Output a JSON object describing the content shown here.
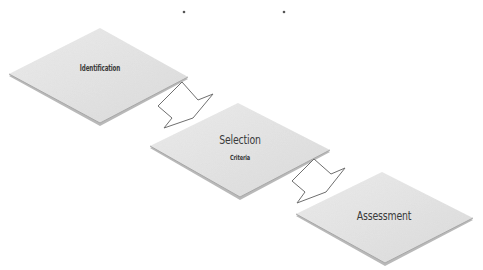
{
  "diagram": {
    "type": "process-flow",
    "steps": [
      {
        "title": "Identification",
        "subtitle": "",
        "polygon": [
          [
            9,
            74
          ],
          [
            100,
            28
          ],
          [
            188,
            77
          ],
          [
            100,
            123
          ]
        ],
        "label_pos": [
          100,
          69
        ]
      },
      {
        "title": "Selection",
        "subtitle": "Criteria",
        "polygon": [
          [
            150,
            146
          ],
          [
            238,
            103
          ],
          [
            330,
            150
          ],
          [
            240,
            197
          ]
        ],
        "label_pos": [
          240,
          138
        ],
        "sub_pos": [
          240,
          158
        ]
      },
      {
        "title": "Assessment",
        "subtitle": "",
        "polygon": [
          [
            296,
            214
          ],
          [
            382,
            172
          ],
          [
            473,
            218
          ],
          [
            385,
            263
          ]
        ],
        "label_pos": [
          384,
          215
        ]
      }
    ],
    "arrows": [
      {
        "from": "Identification",
        "to": "Selection"
      },
      {
        "from": "Selection",
        "to": "Assessment"
      }
    ],
    "colors": {
      "diamond_fill": "#e4e4e4",
      "diamond_edge": "#a8a8a8",
      "arrow_stroke": "#6f6f6f",
      "text": "#3a3a3a"
    }
  }
}
